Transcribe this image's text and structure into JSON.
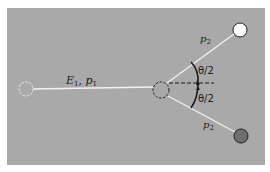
{
  "diagram": {
    "background_color": "#a9a9a9",
    "labels": {
      "incident": "E₁, p₁",
      "incident_E": "E",
      "incident_E_sub": "1",
      "incident_p": "p",
      "incident_p_sub": "1",
      "outgoing_top": "p₂",
      "outgoing_top_p": "p",
      "outgoing_top_sub": "2",
      "outgoing_bottom": "p₂",
      "outgoing_bottom_p": "p",
      "outgoing_bottom_sub": "2",
      "angle_top": "θ/2",
      "angle_bottom": "θ/2"
    },
    "nodes": [
      {
        "id": "initial-position",
        "style": "dashed-white",
        "x": 26,
        "y": 89
      },
      {
        "id": "collision-point",
        "style": "dashed-dark",
        "x": 161,
        "y": 90
      },
      {
        "id": "outgoing-particle-top",
        "style": "solid-white",
        "x": 240,
        "y": 30,
        "color": "#ffffff"
      },
      {
        "id": "outgoing-particle-bottom",
        "style": "solid-dark",
        "x": 241,
        "y": 136,
        "color": "#6e6e6e"
      }
    ]
  }
}
